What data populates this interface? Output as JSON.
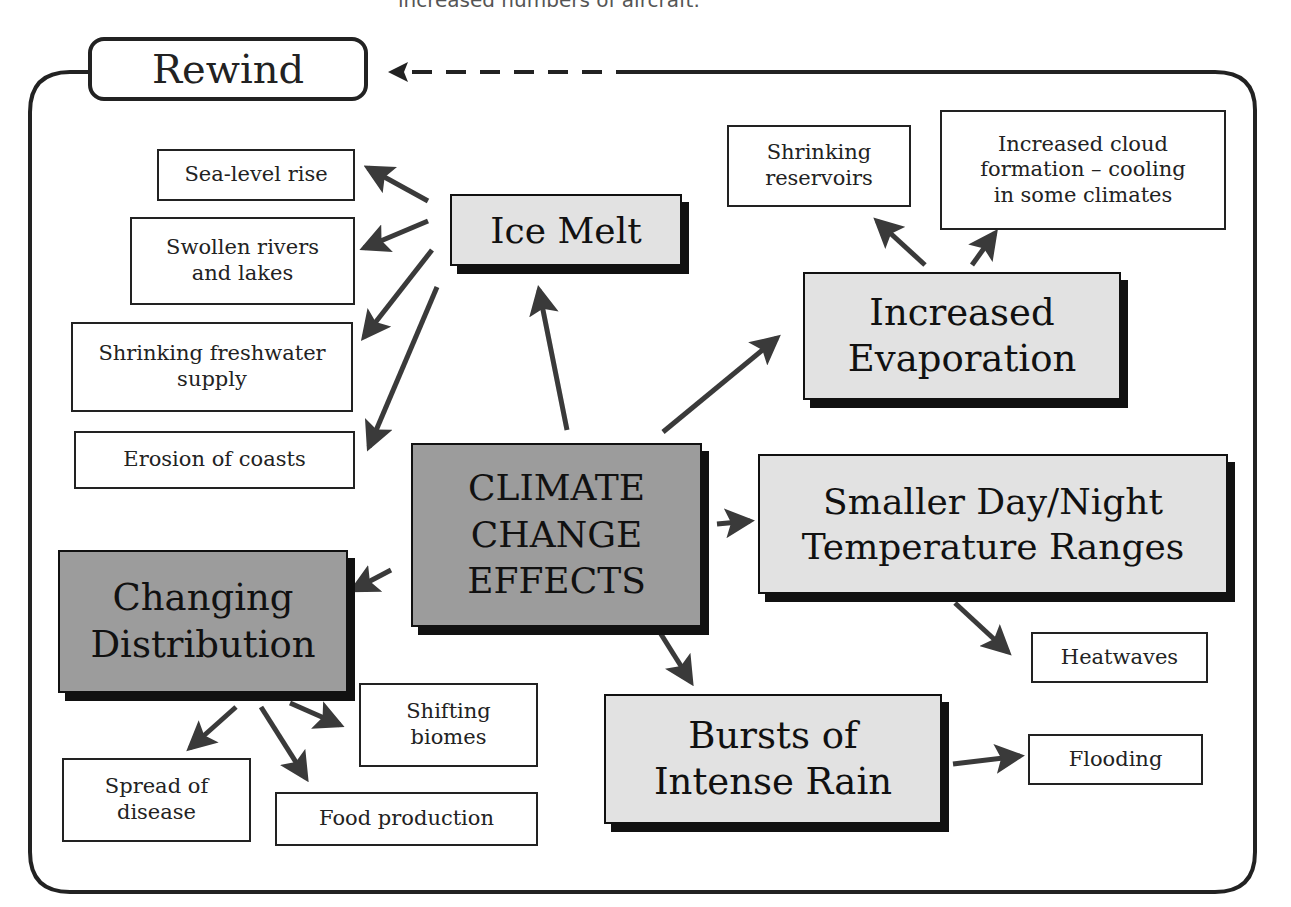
{
  "caption_top": "increased numbers of aircraft.",
  "rewind": {
    "label": "Rewind"
  },
  "center": {
    "lines": [
      "CLIMATE",
      "CHANGE",
      "EFFECTS"
    ]
  },
  "ice_melt": {
    "label": "Ice Melt",
    "effects": [
      "Sea-level rise",
      "Swollen rivers and lakes",
      "Shrinking freshwater supply",
      "Erosion of coasts"
    ]
  },
  "evaporation": {
    "lines": [
      "Increased",
      "Evaporation"
    ],
    "effects": [
      {
        "lines": [
          "Shrinking",
          "reservoirs"
        ]
      },
      {
        "lines": [
          "Increased cloud",
          "formation – cooling",
          "in some climates"
        ]
      }
    ]
  },
  "temperature": {
    "lines": [
      "Smaller Day/Night",
      "Temperature Ranges"
    ],
    "effects": [
      "Heatwaves"
    ]
  },
  "rain": {
    "lines": [
      "Bursts of",
      "Intense Rain"
    ],
    "effects": [
      "Flooding"
    ]
  },
  "distribution": {
    "lines": [
      "Changing",
      "Distribution"
    ],
    "effects": [
      {
        "lines": [
          "Shifting",
          "biomes"
        ]
      },
      {
        "lines": [
          "Spread of",
          "disease"
        ]
      },
      {
        "lines": [
          "Food production"
        ]
      }
    ]
  },
  "colors": {
    "ink": "#222222",
    "arrow": "#3a3a3a",
    "light_box": "#e2e2e2",
    "dark_box": "#9c9c9c"
  }
}
